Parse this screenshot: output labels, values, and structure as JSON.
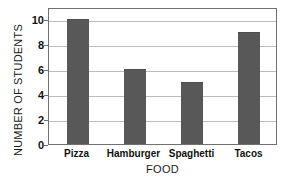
{
  "chart_data": {
    "type": "bar",
    "title": "",
    "subtitle": "",
    "xlabel": "FOOD",
    "ylabel": "NUMBER OF STUDENTS",
    "categories": [
      "Pizza",
      "Hamburger",
      "Spaghetti",
      "Tacos"
    ],
    "values": [
      10,
      6,
      5,
      9
    ],
    "ylim": [
      0,
      11
    ],
    "yticks": [
      0,
      2,
      4,
      6,
      8,
      10
    ],
    "ytick_labels": [
      "0",
      "2",
      "4",
      "6",
      "8",
      "10"
    ],
    "gridlines": [
      2,
      4,
      6,
      8,
      10
    ],
    "grid": "horizontal",
    "legend": "none",
    "annotations": [],
    "colors": {
      "bar_fill": "#585858",
      "bar_edge": "#4e4e4e",
      "gridline": "#bcbcbc",
      "frame": "#707070",
      "background": "#ffffff",
      "text": "#111111"
    }
  }
}
